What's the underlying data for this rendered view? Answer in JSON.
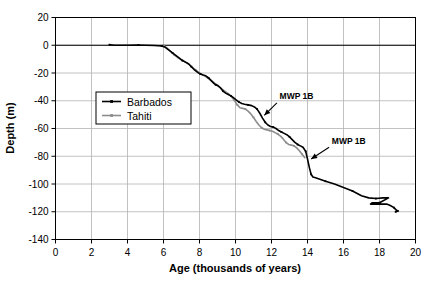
{
  "chart_data": {
    "type": "line",
    "title": "",
    "xlabel": "Age (thousands of years)",
    "ylabel": "Depth (m)",
    "xlim": [
      0,
      20
    ],
    "ylim": [
      -140,
      20
    ],
    "xticks": [
      0,
      2,
      4,
      6,
      8,
      10,
      12,
      14,
      16,
      18,
      20
    ],
    "yticks": [
      20,
      0,
      -20,
      -40,
      -60,
      -80,
      -100,
      -120,
      -140
    ],
    "grid": true,
    "legend_position": "upper-left-inside",
    "series": [
      {
        "name": "Barbados",
        "color": "#000000",
        "points": [
          [
            3.0,
            0.4
          ],
          [
            3.3,
            0.0
          ],
          [
            4.0,
            0.0
          ],
          [
            4.6,
            0.2
          ],
          [
            5.0,
            0.0
          ],
          [
            5.5,
            -0.2
          ],
          [
            5.9,
            -0.5
          ],
          [
            6.1,
            -1.5
          ],
          [
            6.3,
            -3.5
          ],
          [
            6.5,
            -5.5
          ],
          [
            6.7,
            -7.5
          ],
          [
            6.9,
            -9.5
          ],
          [
            7.05,
            -11.0
          ],
          [
            7.2,
            -12.0
          ],
          [
            7.4,
            -13.5
          ],
          [
            7.55,
            -15.5
          ],
          [
            7.7,
            -17.5
          ],
          [
            7.9,
            -19.5
          ],
          [
            8.05,
            -20.8
          ],
          [
            8.2,
            -21.5
          ],
          [
            8.35,
            -22.0
          ],
          [
            8.5,
            -23.5
          ],
          [
            8.65,
            -25.5
          ],
          [
            8.8,
            -27.5
          ],
          [
            8.9,
            -28.5
          ],
          [
            9.0,
            -29.0
          ],
          [
            9.15,
            -30.5
          ],
          [
            9.3,
            -33.0
          ],
          [
            9.45,
            -34.5
          ],
          [
            9.6,
            -35.5
          ],
          [
            9.75,
            -36.5
          ],
          [
            9.9,
            -38.0
          ],
          [
            10.05,
            -39.5
          ],
          [
            10.2,
            -41.0
          ],
          [
            10.35,
            -42.0
          ],
          [
            10.5,
            -42.5
          ],
          [
            10.7,
            -43.0
          ],
          [
            10.9,
            -43.5
          ],
          [
            11.05,
            -44.5
          ],
          [
            11.2,
            -46.0
          ],
          [
            11.35,
            -49.0
          ],
          [
            11.5,
            -52.5
          ],
          [
            11.65,
            -55.5
          ],
          [
            11.8,
            -57.5
          ],
          [
            11.95,
            -58.5
          ],
          [
            12.1,
            -59.0
          ],
          [
            12.25,
            -60.0
          ],
          [
            12.4,
            -61.5
          ],
          [
            12.55,
            -62.5
          ],
          [
            12.7,
            -63.5
          ],
          [
            12.85,
            -64.5
          ],
          [
            13.0,
            -66.0
          ],
          [
            13.15,
            -68.0
          ],
          [
            13.3,
            -70.0
          ],
          [
            13.45,
            -71.5
          ],
          [
            13.6,
            -72.5
          ],
          [
            13.75,
            -73.5
          ],
          [
            13.9,
            -76.5
          ],
          [
            14.0,
            -82.0
          ],
          [
            14.1,
            -88.0
          ],
          [
            14.2,
            -93.0
          ],
          [
            14.3,
            -95.0
          ],
          [
            14.45,
            -95.5
          ],
          [
            15.0,
            -98.0
          ],
          [
            15.5,
            -100.0
          ],
          [
            16.0,
            -102.5
          ],
          [
            16.5,
            -105.0
          ],
          [
            17.0,
            -108.5
          ],
          [
            17.4,
            -110.0
          ],
          [
            17.8,
            -110.5
          ],
          [
            18.2,
            -110.0
          ],
          [
            18.5,
            -110.0
          ],
          [
            18.0,
            -113.5
          ],
          [
            17.6,
            -113.5
          ],
          [
            17.5,
            -114.5
          ],
          [
            18.0,
            -114.5
          ],
          [
            18.4,
            -114.5
          ],
          [
            18.6,
            -115.5
          ],
          [
            18.8,
            -117.0
          ],
          [
            18.95,
            -119.0
          ],
          [
            19.05,
            -119.5
          ],
          [
            18.9,
            -120.0
          ]
        ]
      },
      {
        "name": "Tahiti",
        "color": "#8c8c8c",
        "points": [
          [
            6.0,
            0.0
          ],
          [
            6.2,
            -2.0
          ],
          [
            6.4,
            -4.5
          ],
          [
            6.6,
            -7.0
          ],
          [
            6.8,
            -9.0
          ],
          [
            7.0,
            -10.5
          ],
          [
            7.2,
            -12.0
          ],
          [
            7.4,
            -13.5
          ],
          [
            7.6,
            -16.0
          ],
          [
            7.8,
            -18.0
          ],
          [
            8.0,
            -20.0
          ],
          [
            8.2,
            -21.5
          ],
          [
            8.4,
            -23.0
          ],
          [
            8.6,
            -25.0
          ],
          [
            8.8,
            -27.0
          ],
          [
            9.0,
            -29.0
          ],
          [
            9.2,
            -31.0
          ],
          [
            9.4,
            -33.0
          ],
          [
            9.6,
            -35.0
          ],
          [
            9.8,
            -37.5
          ],
          [
            9.95,
            -40.0
          ],
          [
            10.1,
            -43.0
          ],
          [
            10.25,
            -45.0
          ],
          [
            10.4,
            -45.5
          ],
          [
            10.55,
            -46.0
          ],
          [
            10.7,
            -47.5
          ],
          [
            10.85,
            -49.5
          ],
          [
            11.0,
            -52.0
          ],
          [
            11.15,
            -55.0
          ],
          [
            11.3,
            -57.5
          ],
          [
            11.45,
            -59.5
          ],
          [
            11.6,
            -60.5
          ],
          [
            11.75,
            -61.0
          ],
          [
            11.9,
            -61.5
          ],
          [
            12.05,
            -62.0
          ],
          [
            12.2,
            -63.0
          ],
          [
            12.35,
            -64.0
          ],
          [
            12.5,
            -65.5
          ],
          [
            12.65,
            -67.5
          ],
          [
            12.8,
            -70.0
          ],
          [
            12.95,
            -71.5
          ],
          [
            13.1,
            -72.0
          ],
          [
            13.25,
            -72.5
          ],
          [
            13.4,
            -74.0
          ],
          [
            13.55,
            -76.0
          ],
          [
            13.7,
            -78.5
          ],
          [
            13.85,
            -81.0
          ]
        ]
      }
    ],
    "annotations": [
      {
        "label": "MWP 1B",
        "text_x": 12.45,
        "text_y": -39.0,
        "arrow_from_x": 12.3,
        "arrow_from_y": -41.5,
        "arrow_to_x": 11.6,
        "arrow_to_y": -50.5
      },
      {
        "label": "MWP 1B",
        "text_x": 15.35,
        "text_y": -71.0,
        "arrow_from_x": 15.2,
        "arrow_from_y": -73.5,
        "arrow_to_x": 14.2,
        "arrow_to_y": -82.0
      }
    ]
  },
  "colors": {
    "barbados": "#000000",
    "tahiti": "#8c8c8c",
    "grid": "#b3b3b3",
    "axis": "#000000",
    "background": "#ffffff"
  }
}
